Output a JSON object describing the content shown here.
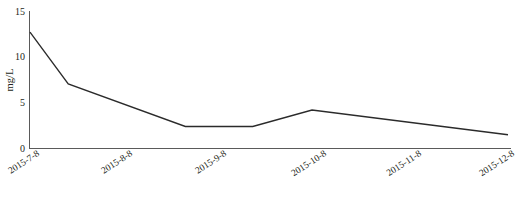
{
  "chart_data": {
    "type": "line",
    "title": "",
    "xlabel": "",
    "ylabel": "mg/L",
    "x": [
      "2015-7-8",
      "2015-8-8",
      "2015-9-8",
      "2015-10-8",
      "2015-11-8",
      "2015-12-8"
    ],
    "categories": [
      "2015-7-8",
      "2015-8-8",
      "2015-9-8",
      "2015-10-8",
      "2015-11-8",
      "2015-12-8"
    ],
    "values": [
      12.7,
      7.1,
      2.4,
      4.2,
      3.0,
      1.5
    ],
    "vertices": [
      {
        "x_frac": 0.0,
        "value": 12.7
      },
      {
        "x_frac": 0.08,
        "value": 7.05
      },
      {
        "x_frac": 0.325,
        "value": 2.4
      },
      {
        "x_frac": 0.466,
        "value": 2.4
      },
      {
        "x_frac": 0.59,
        "value": 4.2
      },
      {
        "x_frac": 1.0,
        "value": 1.5
      }
    ],
    "ylim": [
      0,
      15
    ],
    "yticks": [
      0,
      5,
      10,
      15
    ],
    "ytick_labels": [
      "0",
      "5",
      "10",
      "15"
    ],
    "grid": false,
    "legend": false,
    "legend_position": "none",
    "series": [
      {
        "name": "mg/L",
        "values": [
          12.7,
          7.05,
          2.4,
          2.4,
          4.2,
          1.5
        ]
      }
    ],
    "line_color": "#2b2b2b",
    "axis_color": "#5a5a5a"
  },
  "axis": {
    "y_label": "mg/L",
    "y_ticks": [
      "15",
      "10",
      "5",
      "0"
    ],
    "x_ticks": [
      "2015-7-8",
      "2015-8-8",
      "2015-9-8",
      "2015-10-8",
      "2015-11-8",
      "2015-12-8"
    ]
  },
  "caption": {
    "text": ""
  }
}
